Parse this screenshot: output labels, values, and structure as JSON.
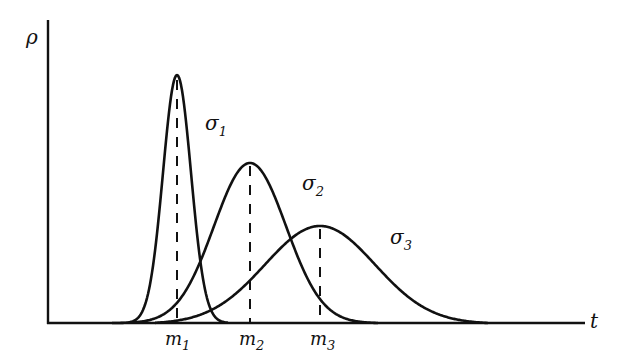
{
  "chart_data": {
    "type": "line",
    "title": "",
    "xlabel": "t",
    "ylabel": "ρ",
    "grid": false,
    "legend": "inline labels next to curves",
    "x_ticks": [
      "m1",
      "m2",
      "m3"
    ],
    "series": [
      {
        "name": "σ1",
        "mean_label": "m1",
        "mean_px": 177,
        "peak_px": 75,
        "start_px": 112,
        "end_px": 228,
        "sigma_px": 14,
        "description": "narrow, tall bell curve"
      },
      {
        "name": "σ2",
        "mean_label": "m2",
        "mean_px": 250,
        "peak_px": 163,
        "start_px": 128,
        "end_px": 378,
        "sigma_px": 36,
        "description": "medium bell curve"
      },
      {
        "name": "σ3",
        "mean_label": "m3",
        "mean_px": 320,
        "peak_px": 226,
        "start_px": 155,
        "end_px": 488,
        "sigma_px": 55,
        "description": "wide, low bell curve"
      }
    ],
    "relation": "σ1 < σ2 < σ3; m1 < m2 < m3"
  },
  "labels": {
    "y_axis": "ρ",
    "x_axis": "t",
    "m1": "m",
    "m1_sub": "1",
    "m2": "m",
    "m2_sub": "2",
    "m3": "m",
    "m3_sub": "3",
    "s1": "σ",
    "s1_sub": "1",
    "s2": "σ",
    "s2_sub": "2",
    "s3": "σ",
    "s3_sub": "3"
  }
}
